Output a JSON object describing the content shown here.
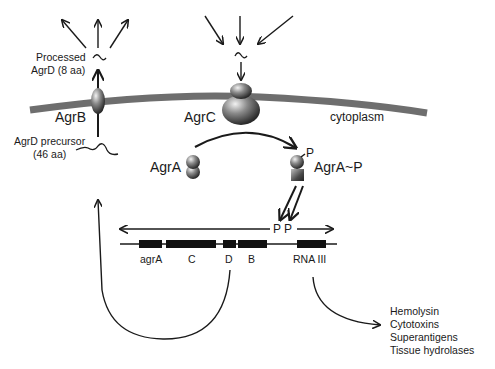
{
  "labels": {
    "processed_agrd_line1": "Processed",
    "processed_agrd_line2": "AgrD (8 aa)",
    "agrb": "AgrB",
    "agrc": "AgrC",
    "cytoplasm": "cytoplasm",
    "agrd_precursor_line1": "AgrD precursor",
    "agrd_precursor_line2": "(46 aa)",
    "agra": "AgrA",
    "agra_p": "AgrA~P",
    "phosphate": "P",
    "promoter_p2": "P",
    "promoter_p3": "P"
  },
  "operon": {
    "genes": [
      "agrA",
      "C",
      "D",
      "B",
      "RNA III"
    ]
  },
  "outputs": {
    "items": [
      "Hemolysin",
      "Cytotoxins",
      "Superantigens",
      "Tissue hydrolases"
    ]
  },
  "colors": {
    "membrane": "#6e6e6e",
    "protein_dark": "#3a3a3a",
    "protein_light": "#d8d8d8",
    "line": "#1a1a1a",
    "gene_block": "#111111"
  }
}
